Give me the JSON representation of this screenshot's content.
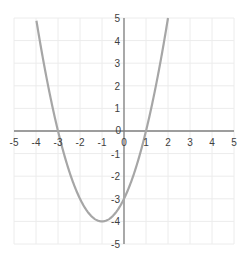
{
  "chart_data": {
    "type": "line",
    "title": "",
    "xlabel": "",
    "ylabel": "",
    "function": "y = x^2 + 2x - 3",
    "xlim": [
      -5,
      5
    ],
    "ylim": [
      -5,
      5
    ],
    "grid": true,
    "legend": null,
    "x_ticks": [
      -5,
      -4,
      -3,
      -2,
      -1,
      0,
      1,
      2,
      3,
      4,
      5
    ],
    "y_ticks": [
      -5,
      -4,
      -3,
      -2,
      -1,
      0,
      1,
      2,
      3,
      4,
      5
    ],
    "series": [
      {
        "name": "parabola",
        "color": "#a6a6a6",
        "x": [
          -4.16,
          -4,
          -3.5,
          -3,
          -2.5,
          -2,
          -1.5,
          -1,
          -0.5,
          0,
          0.5,
          1,
          1.5,
          2,
          2.16
        ],
        "y": [
          5,
          5,
          0.25,
          0,
          -1.75,
          -3,
          -3.75,
          -4,
          -3.75,
          -3,
          -1.75,
          0,
          2.25,
          5,
          5
        ]
      }
    ],
    "key_points": {
      "roots": [
        -3,
        1
      ],
      "vertex": [
        -1,
        -4
      ],
      "y_intercept": -3
    }
  },
  "colors": {
    "axis": "#7f7f7f",
    "grid": "#ececec",
    "curve": "#a6a6a6",
    "tick_text": "#404040"
  }
}
